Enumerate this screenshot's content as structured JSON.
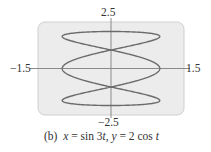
{
  "chart_data": {
    "type": "line",
    "subtype": "parametric",
    "title": "",
    "caption": "(b)  x = sin 3t, y = 2 cos t",
    "equations": {
      "x": "sin 3t",
      "y": "2 cos t",
      "t_range": [
        0,
        6.283185307
      ]
    },
    "xlim": [
      -1.5,
      1.5
    ],
    "ylim": [
      -2.5,
      2.5
    ],
    "tick_labels": {
      "x_min": "−1.5",
      "x_max": "1.5",
      "y_min": "−2.5",
      "y_max": "2.5"
    },
    "grid": false,
    "legend": null,
    "series": [
      {
        "name": "x = sin 3t, y = 2 cos t",
        "color": "#6b6b6b",
        "x_extent": [
          -1,
          1
        ],
        "y_extent": [
          -2,
          2
        ],
        "self_intersections": [
          [
            0,
            1.0
          ],
          [
            0,
            -1.0
          ]
        ]
      }
    ],
    "xlabel": "",
    "ylabel": ""
  },
  "labels": {
    "y_max": "2.5",
    "y_min": "−2.5",
    "x_min": "−1.5",
    "x_max": "1.5",
    "caption_prefix": "(b)",
    "caption_x": "x",
    "caption_eq1": " = sin 3",
    "caption_t1": "t",
    "caption_sep": ", ",
    "caption_y": "y",
    "caption_eq2": " = 2 cos ",
    "caption_t2": "t"
  },
  "style": {
    "frame_fill": "#ececec",
    "frame_stroke": "#cfcfcf",
    "axis_color": "#8a8a8a",
    "curve_color": "#6b6b6b"
  },
  "layout": {
    "frame": {
      "x": 38,
      "y": 22,
      "w": 146,
      "h": 93,
      "r": 7
    },
    "origin": {
      "x": 111,
      "y": 68.5
    },
    "scale": {
      "x": 48.8,
      "y": 18.5
    },
    "axis_h": {
      "x1": 30,
      "x2": 190
    },
    "axis_v": {
      "y1": 18,
      "y2": 118
    }
  }
}
